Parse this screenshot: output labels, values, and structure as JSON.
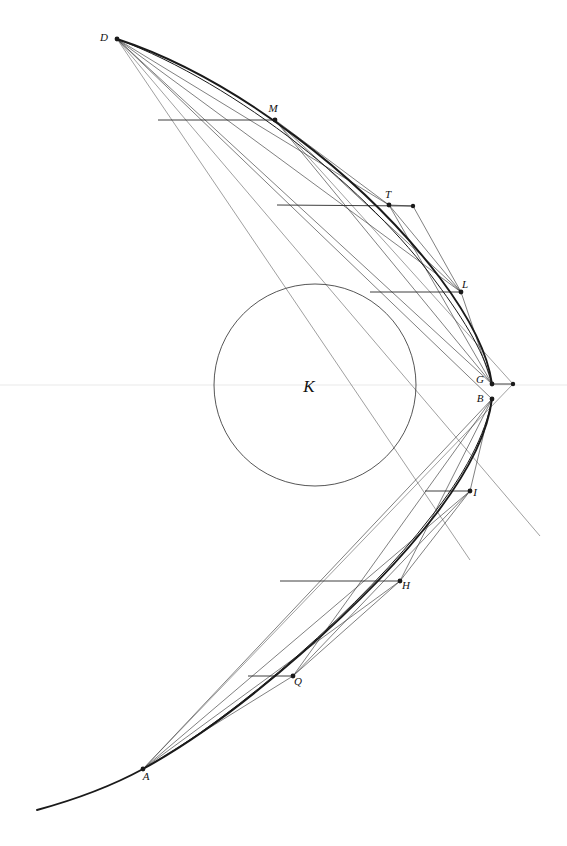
{
  "figure": {
    "background_color": "#ffffff",
    "stroke_color": "#2b2b2b",
    "axis_color": "#e9e9e9",
    "width": 567,
    "height": 846
  },
  "labels": {
    "K": "K",
    "D": "D",
    "M": "M",
    "T": "T",
    "L": "L",
    "G": "G",
    "B": "B",
    "I": "I",
    "H": "H",
    "Q": "Q",
    "A": "A"
  },
  "points": {
    "K": {
      "label": "K",
      "x": 315,
      "y": 385,
      "dot": false,
      "label_dx": -6,
      "label_dy": 7,
      "size": "big"
    },
    "D": {
      "label": "D",
      "x": 117,
      "y": 39,
      "dot": true,
      "label_dx": -13,
      "label_dy": 2
    },
    "M": {
      "label": "M",
      "x": 275,
      "y": 120,
      "dot": true,
      "label_dx": -2,
      "label_dy": -8
    },
    "T": {
      "label": "T",
      "x": 389,
      "y": 205,
      "dot": true,
      "label_dx": -1,
      "label_dy": -7
    },
    "L": {
      "label": "L",
      "x": 461,
      "y": 292,
      "dot": true,
      "label_dx": 4,
      "label_dy": -4
    },
    "G": {
      "label": "G",
      "x": 492,
      "y": 384,
      "dot": true,
      "label_dx": -12,
      "label_dy": -1
    },
    "B": {
      "label": "B",
      "x": 492,
      "y": 399,
      "dot": true,
      "label_dx": -12,
      "label_dy": 3
    },
    "I": {
      "label": "I",
      "x": 470,
      "y": 491,
      "dot": true,
      "label_dx": 5,
      "label_dy": 5
    },
    "H": {
      "label": "H",
      "x": 400,
      "y": 581,
      "dot": true,
      "label_dx": 6,
      "label_dy": 8
    },
    "Q": {
      "label": "Q",
      "x": 293,
      "y": 676,
      "dot": true,
      "label_dx": 5,
      "label_dy": 9
    },
    "A": {
      "label": "A",
      "x": 143,
      "y": 769,
      "dot": true,
      "label_dx": 3,
      "label_dy": 11
    }
  },
  "circle": {
    "name": "circle-K",
    "cx": 315,
    "cy": 385,
    "r": 101
  },
  "axis": {
    "name": "horizontal-axis",
    "y": 385,
    "x1": 0,
    "x2": 567
  },
  "incoming_rays": [
    {
      "name": "ray-to-M",
      "x1": 158,
      "y1": 120,
      "x2": 275,
      "y2": 120
    },
    {
      "name": "ray-to-T",
      "x1": 277,
      "y1": 205,
      "x2": 413,
      "y2": 206
    },
    {
      "name": "ray-to-L",
      "x1": 370,
      "y1": 292,
      "x2": 461,
      "y2": 292
    },
    {
      "name": "ray-to-G",
      "x1": 492,
      "y1": 384,
      "x2": 513,
      "y2": 384
    },
    {
      "name": "ray-to-I",
      "x1": 425,
      "y1": 491,
      "x2": 470,
      "y2": 491
    },
    {
      "name": "ray-to-H",
      "x1": 280,
      "y1": 581,
      "x2": 400,
      "y2": 581
    },
    {
      "name": "ray-to-Q",
      "x1": 248,
      "y1": 676,
      "x2": 293,
      "y2": 676
    }
  ],
  "ray_end_dots": [
    {
      "name": "ray-end-dot-T",
      "x": 413,
      "y": 206
    },
    {
      "name": "ray-end-dot-G",
      "x": 513,
      "y": 384
    }
  ],
  "reflected_chords": [
    {
      "name": "chord-D-G",
      "x1": 117,
      "y1": 39,
      "x2": 492,
      "y2": 384
    },
    {
      "name": "chord-D-L",
      "x1": 117,
      "y1": 39,
      "x2": 461,
      "y2": 292
    },
    {
      "name": "chord-D-T",
      "x1": 117,
      "y1": 39,
      "x2": 389,
      "y2": 205
    },
    {
      "name": "chord-D-B",
      "x1": 117,
      "y1": 39,
      "x2": 492,
      "y2": 399
    },
    {
      "name": "chord-M-G",
      "x1": 275,
      "y1": 120,
      "x2": 492,
      "y2": 384
    },
    {
      "name": "chord-M-L",
      "x1": 275,
      "y1": 120,
      "x2": 461,
      "y2": 292
    },
    {
      "name": "chord-M-T",
      "x1": 275,
      "y1": 120,
      "x2": 389,
      "y2": 205
    },
    {
      "name": "chord-T-G",
      "x1": 389,
      "y1": 205,
      "x2": 492,
      "y2": 384
    },
    {
      "name": "chord-T-L",
      "x1": 389,
      "y1": 205,
      "x2": 461,
      "y2": 292
    },
    {
      "name": "chord-L-G",
      "x1": 461,
      "y1": 292,
      "x2": 492,
      "y2": 384
    },
    {
      "name": "chord-T-rayend",
      "x1": 389,
      "y1": 205,
      "x2": 413,
      "y2": 206
    },
    {
      "name": "chord-rayend-L",
      "x1": 413,
      "y1": 206,
      "x2": 461,
      "y2": 292
    },
    {
      "name": "chord-A-B",
      "x1": 143,
      "y1": 769,
      "x2": 492,
      "y2": 399
    },
    {
      "name": "chord-A-I",
      "x1": 143,
      "y1": 769,
      "x2": 470,
      "y2": 491
    },
    {
      "name": "chord-A-H",
      "x1": 143,
      "y1": 769,
      "x2": 400,
      "y2": 581
    },
    {
      "name": "chord-A-Q",
      "x1": 143,
      "y1": 769,
      "x2": 293,
      "y2": 676
    },
    {
      "name": "chord-Q-B",
      "x1": 293,
      "y1": 676,
      "x2": 492,
      "y2": 399
    },
    {
      "name": "chord-Q-I",
      "x1": 293,
      "y1": 676,
      "x2": 470,
      "y2": 491
    },
    {
      "name": "chord-Q-H",
      "x1": 293,
      "y1": 676,
      "x2": 400,
      "y2": 581
    },
    {
      "name": "chord-H-B",
      "x1": 400,
      "y1": 581,
      "x2": 492,
      "y2": 399
    },
    {
      "name": "chord-H-I",
      "x1": 400,
      "y1": 581,
      "x2": 470,
      "y2": 491
    },
    {
      "name": "chord-I-B",
      "x1": 470,
      "y1": 491,
      "x2": 492,
      "y2": 399
    }
  ],
  "long_diagonals": [
    {
      "name": "diagonal-D-lower-right",
      "x1": 117,
      "y1": 39,
      "x2": 540,
      "y2": 536
    },
    {
      "name": "diagonal-D-lower-far",
      "x1": 117,
      "y1": 39,
      "x2": 470,
      "y2": 560
    },
    {
      "name": "diagonal-M-lower",
      "x1": 275,
      "y1": 120,
      "x2": 513,
      "y2": 384
    },
    {
      "name": "diagonal-A-upper",
      "x1": 143,
      "y1": 769,
      "x2": 513,
      "y2": 384
    }
  ],
  "caustic_upper": {
    "name": "caustic-upper-branch",
    "path": "M 117,39 C 236,78 366,180 440,278 C 470,318 488,354 492,384"
  },
  "caustic_lower": {
    "name": "caustic-lower-branch",
    "path": "M 492,399 C 488,432 468,472 436,514 C 370,600 240,716 143,769 C 110,787 70,801 37,810"
  },
  "caustic_inner_upper": {
    "name": "caustic-inner-upper",
    "path": "M 117,39 C 240,85 370,192 436,282 C 466,322 486,356 492,385"
  },
  "caustic_inner_lower": {
    "name": "caustic-inner-lower",
    "path": "M 492,399 C 486,434 464,476 430,518 C 366,602 238,716 143,769"
  }
}
